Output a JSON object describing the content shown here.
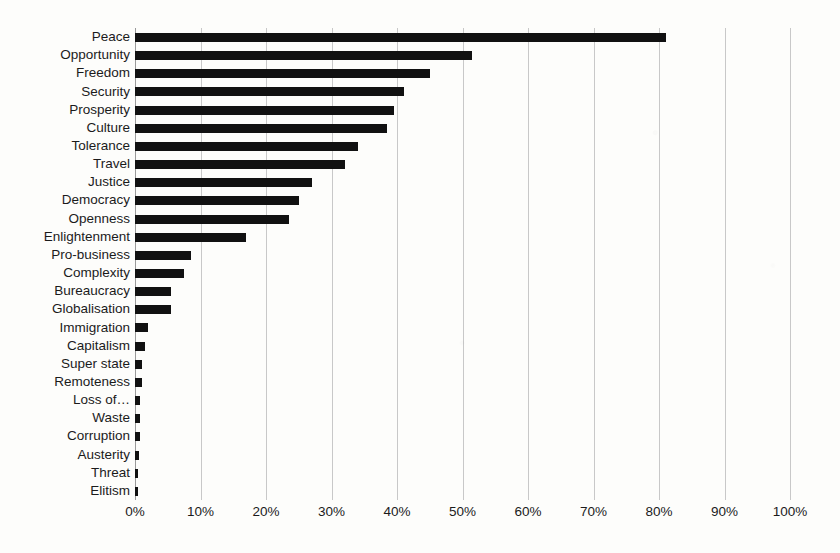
{
  "chart_data": {
    "type": "bar",
    "orientation": "horizontal",
    "title": "",
    "xlabel": "",
    "ylabel": "",
    "xlim": [
      0,
      100
    ],
    "xtick_labels": [
      "0%",
      "10%",
      "20%",
      "30%",
      "40%",
      "50%",
      "60%",
      "70%",
      "80%",
      "90%",
      "100%"
    ],
    "xtick_values": [
      0,
      10,
      20,
      30,
      40,
      50,
      60,
      70,
      80,
      90,
      100
    ],
    "grid": true,
    "legend": false,
    "value_suffix": "%",
    "bar_color": "#111111",
    "grid_color": "#c8c8c8",
    "background_color": "#fdfdfb",
    "categories": [
      "Peace",
      "Opportunity",
      "Freedom",
      "Security",
      "Prosperity",
      "Culture",
      "Tolerance",
      "Travel",
      "Justice",
      "Democracy",
      "Openness",
      "Enlightenment",
      "Pro-business",
      "Complexity",
      "Bureaucracy",
      "Globalisation",
      "Immigration",
      "Capitalism",
      "Super state",
      "Remoteness",
      "Loss of…",
      "Waste",
      "Corruption",
      "Austerity",
      "Threat",
      "Elitism"
    ],
    "values": [
      81,
      51.5,
      45,
      41,
      39.5,
      38.5,
      34,
      32,
      27,
      25,
      23.5,
      17,
      8.5,
      7.5,
      5.5,
      5.5,
      2,
      1.5,
      1,
      1,
      0.8,
      0.7,
      0.7,
      0.6,
      0.4,
      0.4
    ]
  }
}
